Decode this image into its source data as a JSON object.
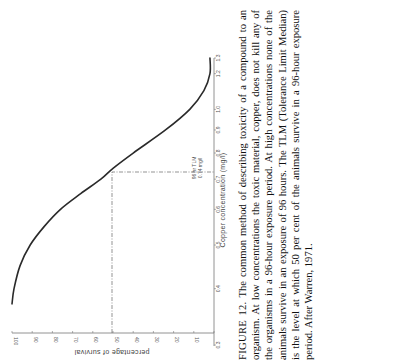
{
  "figure": {
    "label": "FIGURE 12.",
    "caption": "The common method of describing toxicity of a compound to an organism. At low concentrations the toxic material, copper, does not kill any of the organisms in a 96-hour exposure period. At high concentrations none of the animals survive in an exposure of 96 hours. The TLM (Tolerance Limit Median) is the level at which 50 per cent of the animals survive in a 96-hour exposure period. After Warren, 1971."
  },
  "chart_data": {
    "type": "line",
    "orientation": "rotated 90 degrees counter-clockwise on page",
    "title": "",
    "xlabel": "Copper concentration (mg/l)",
    "ylabel": "percentage of survival",
    "x_ticks": [
      "0.3",
      "0.4",
      "0.5",
      "0.6",
      "0.7",
      "0.8",
      "0.9",
      "1.0",
      "1.2",
      "1.3"
    ],
    "y_ticks": [
      "100",
      "90",
      "80",
      "70",
      "60",
      "50",
      "40",
      "30",
      "20",
      "10",
      "0"
    ],
    "xlim": [
      0.3,
      1.3
    ],
    "ylim": [
      0,
      100
    ],
    "grid": false,
    "series": [
      {
        "name": "survival",
        "x": [
          0.37,
          0.4,
          0.45,
          0.5,
          0.55,
          0.6,
          0.65,
          0.7,
          0.74,
          0.8,
          0.9,
          1.0,
          1.1,
          1.2,
          1.3
        ],
        "y": [
          100,
          99,
          96,
          91,
          84,
          76,
          66,
          56,
          50,
          40,
          24,
          12,
          5,
          2,
          2
        ]
      }
    ],
    "annotations": [
      {
        "text_line1": "96 hr TLM",
        "text_line2": "0.74 mg/l",
        "x": 0.74,
        "y": 50
      }
    ],
    "reference_lines": [
      {
        "type": "dash-dot",
        "from": [
          0.3,
          50
        ],
        "to": [
          0.74,
          50
        ]
      },
      {
        "type": "dash-dot",
        "from": [
          0.74,
          50
        ],
        "to": [
          0.74,
          0
        ]
      }
    ]
  },
  "axes": {
    "xlabel": "Copper concentration   (mg/l)",
    "ylabel": "percentage  of  survival",
    "annotation_line1": "96 hr TLM",
    "annotation_line2": "0.74 mg/l"
  }
}
